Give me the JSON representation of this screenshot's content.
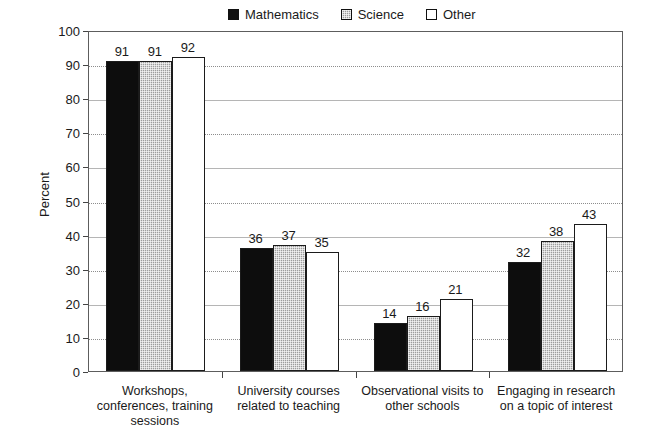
{
  "chart_data": {
    "type": "bar",
    "title": "",
    "xlabel": "",
    "ylabel": "Percent",
    "ylim": [
      0,
      100
    ],
    "ytick_step": 10,
    "yticks": [
      "100",
      "90",
      "80",
      "70",
      "60",
      "50",
      "40",
      "30",
      "20",
      "10",
      "0"
    ],
    "grid": true,
    "grid_style": "alternating solid and dotted horizontal gridlines",
    "legend_position": "top-center",
    "categories": [
      "Workshops,\nconferences, training\nsessions",
      "University courses\nrelated to teaching",
      "Observational visits to\nother schools",
      "Engaging in research\non a topic of interest"
    ],
    "series": [
      {
        "name": "Mathematics",
        "color": "#0d0d0d",
        "values": [
          91,
          36,
          14,
          32
        ]
      },
      {
        "name": "Science",
        "color": "#9d9d9d",
        "values": [
          91,
          37,
          16,
          38
        ]
      },
      {
        "name": "Other",
        "color": "#ffffff",
        "values": [
          92,
          35,
          21,
          43
        ]
      }
    ]
  },
  "legend": {
    "entries": [
      {
        "label": "Mathematics",
        "swatch": "black-filled-square"
      },
      {
        "label": "Science",
        "swatch": "gray-stippled-square"
      },
      {
        "label": "Other",
        "swatch": "white-outlined-square"
      }
    ]
  },
  "axis": {
    "y_title": "Percent"
  }
}
